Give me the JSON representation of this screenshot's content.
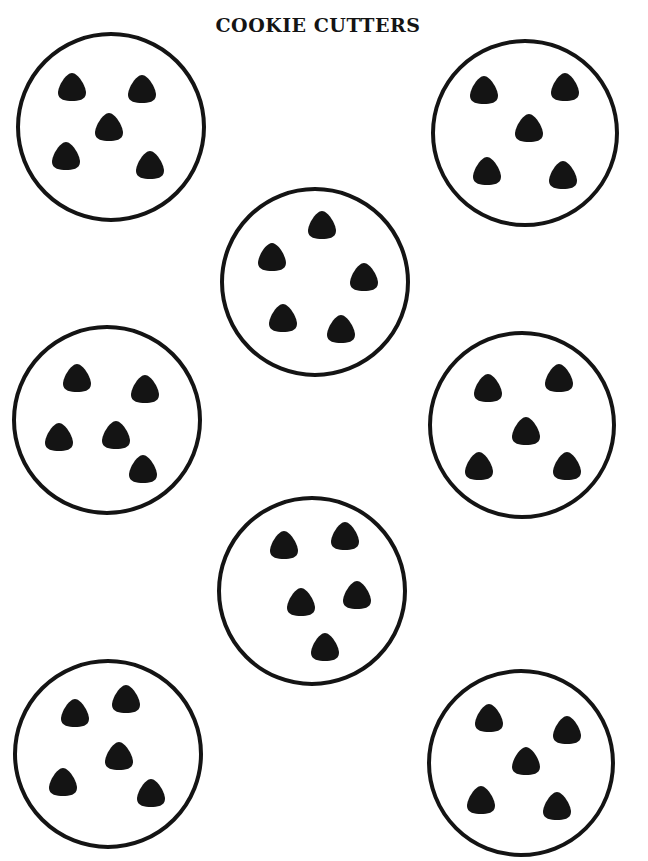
{
  "page": {
    "title": "COOKIE CUTTERS",
    "ink_color": "#141414",
    "paper_color": "#ffffff"
  },
  "cookies": [
    {
      "id": "cookie-1",
      "position": "top-left",
      "chip_count": 5
    },
    {
      "id": "cookie-2",
      "position": "top-right",
      "chip_count": 5
    },
    {
      "id": "cookie-3",
      "position": "upper-center",
      "chip_count": 5
    },
    {
      "id": "cookie-4",
      "position": "middle-left",
      "chip_count": 5
    },
    {
      "id": "cookie-5",
      "position": "middle-right",
      "chip_count": 5
    },
    {
      "id": "cookie-6",
      "position": "lower-center",
      "chip_count": 5
    },
    {
      "id": "cookie-7",
      "position": "bottom-left",
      "chip_count": 5
    },
    {
      "id": "cookie-8",
      "position": "bottom-right",
      "chip_count": 5
    }
  ],
  "icons": {
    "cookie": "cookie-outline-icon",
    "chip": "chocolate-chip-icon"
  }
}
